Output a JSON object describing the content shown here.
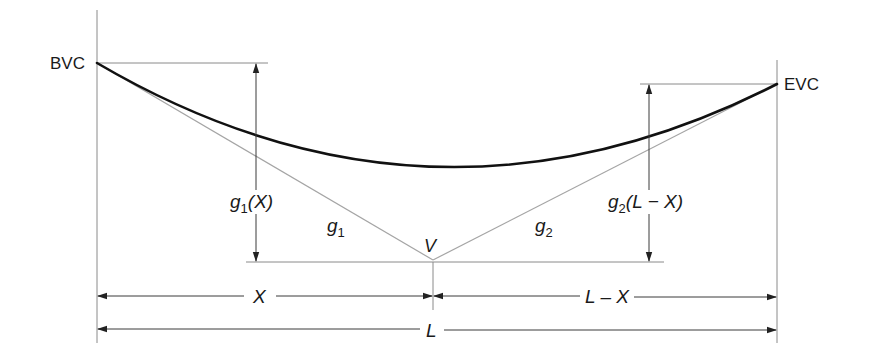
{
  "diagram": {
    "points": {
      "bvc": {
        "label": "BVC"
      },
      "evc": {
        "label": "EVC"
      },
      "vertex": {
        "label": "V"
      }
    },
    "grades": {
      "g1": {
        "symbol": "g",
        "subscript": "1"
      },
      "g2": {
        "symbol": "g",
        "subscript": "2"
      }
    },
    "offsets": {
      "left": {
        "prefix": "g",
        "subscript": "1",
        "suffix": "(X)"
      },
      "right": {
        "prefix": "g",
        "subscript": "2",
        "suffix": "(L − X)"
      }
    },
    "dimensions": {
      "x_label": "X",
      "l_minus_x_label": "L – X",
      "l_label": "L"
    },
    "colors": {
      "curve": "#111111",
      "tangent": "#a5a5a5",
      "guide": "#8a8a8a",
      "text": "#1a1a1a"
    }
  }
}
